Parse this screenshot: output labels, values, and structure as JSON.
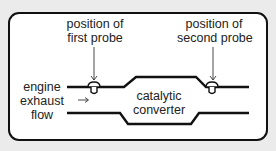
{
  "diagram": {
    "labels": {
      "probe1_line1": "position of",
      "probe1_line2": "first probe",
      "probe2_line1": "position of",
      "probe2_line2": "second probe",
      "engine_line1": "engine",
      "engine_line2": "exhaust",
      "engine_line3": "flow",
      "converter_line1": "catalytic",
      "converter_line2": "converter"
    },
    "icons": {
      "flow_arrow": "right-arrow-icon",
      "probe": "probe-icon",
      "pointer": "down-arrow-icon"
    },
    "colors": {
      "background": "#ebebeb",
      "panel": "#ffffff",
      "stroke": "#111111",
      "text": "#222222"
    }
  }
}
